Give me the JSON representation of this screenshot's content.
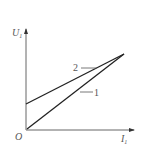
{
  "axes": {
    "y_label": "U",
    "y_sub": "1",
    "x_label": "I",
    "x_sub": "1",
    "origin_label": "O"
  },
  "lines": [
    {
      "id": "1",
      "label": "1",
      "description": "line through origin",
      "from": [
        0,
        0
      ],
      "to": [
        1,
        1
      ]
    },
    {
      "id": "2",
      "label": "2",
      "description": "line with positive intercept",
      "from": [
        0,
        0.34
      ],
      "to": [
        1,
        1
      ]
    }
  ],
  "colors": {
    "axis": "#555555",
    "line": "#222222",
    "text": "#555555"
  }
}
